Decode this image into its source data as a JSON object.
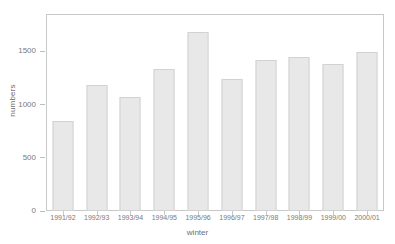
{
  "chart_data": {
    "type": "bar",
    "title": "",
    "xlabel": "winter",
    "ylabel": "numbers",
    "categories": [
      "1991/92",
      "1992/93",
      "1993/94",
      "1994/95",
      "1995/96",
      "1996/97",
      "1997/98",
      "1998/99",
      "1999/00",
      "2000/01"
    ],
    "values": [
      850,
      1180,
      1070,
      1330,
      1680,
      1240,
      1420,
      1450,
      1380,
      1490
    ],
    "ylim": [
      0,
      1850
    ],
    "yticks": [
      0,
      500,
      1000,
      1500
    ],
    "ytick_labels": [
      "0",
      "500",
      "1000",
      "1500"
    ],
    "grid": false,
    "legend": null,
    "colors": {
      "bar_fill": "#e8e8e8",
      "bar_edge": "#d2d2d2",
      "axis": "#c8c8c8",
      "text": "#7a7a7a",
      "background": "#ffffff"
    }
  }
}
